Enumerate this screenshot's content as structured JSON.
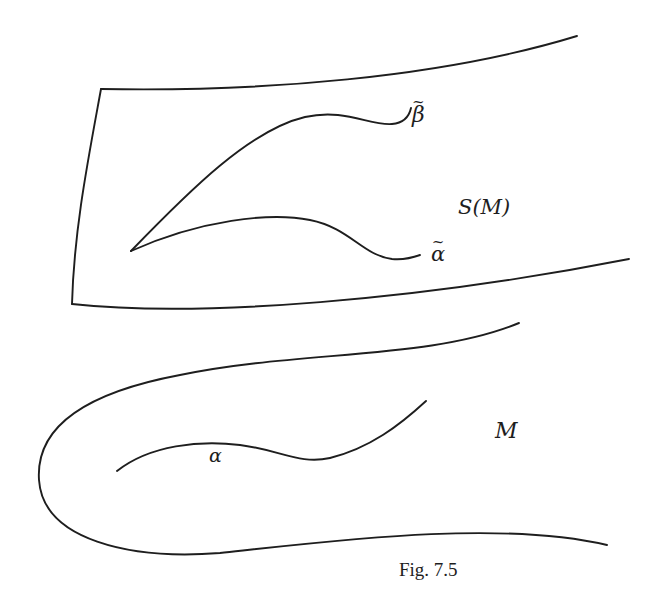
{
  "figure": {
    "caption": "Fig. 7.5",
    "labels": {
      "beta_tilde": "β",
      "alpha_tilde": "α",
      "tilde_mark": "~",
      "surface": "S(M)",
      "alpha": "α",
      "manifold": "M"
    },
    "regions": [
      {
        "name": "S(M)",
        "description": "upper sheet bounded by a curved quadrilateral-like shape, open on the right"
      },
      {
        "name": "M",
        "description": "lower U-shaped band opening to the right"
      }
    ],
    "curves": [
      {
        "name": "beta-tilde",
        "in": "S(M)",
        "from": [
          131,
          251
        ],
        "to": [
          405,
          121
        ]
      },
      {
        "name": "alpha-tilde",
        "in": "S(M)",
        "from": [
          131,
          251
        ],
        "to": [
          420,
          255
        ]
      },
      {
        "name": "alpha",
        "in": "M",
        "from": [
          117,
          471
        ],
        "to": [
          426,
          401
        ]
      }
    ],
    "stroke_color": "#1e1e1e",
    "background_color": "#ffffff"
  }
}
